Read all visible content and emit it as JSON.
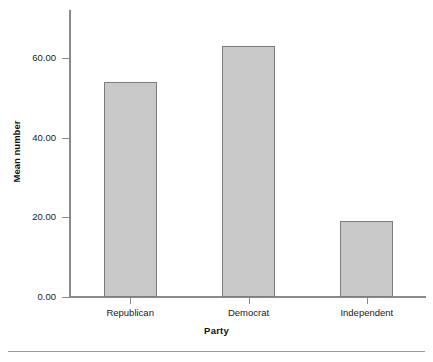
{
  "chart_data": {
    "type": "bar",
    "title": "",
    "subtitle": "",
    "xlabel": "Party",
    "ylabel": "Mean number",
    "categories": [
      "Republican",
      "Democrat",
      "Independent"
    ],
    "values": [
      54,
      63,
      19
    ],
    "ylim": [
      0,
      72
    ],
    "ytick_values": [
      0,
      20,
      40,
      60
    ],
    "ytick_labels": [
      "0.00",
      "20.00",
      "40.00",
      "60.00"
    ],
    "grid": false,
    "legend": false,
    "legend_position": "none",
    "bar_fill_color": "#c9c9c9",
    "bar_border_color": "#7d7d7d",
    "axis_color": "#8a8a8a",
    "text_color": "#1a1a1a",
    "background_color": "#ffffff",
    "annotations": []
  },
  "figure": {
    "bottom_rule_color": "#9a9a9a"
  }
}
